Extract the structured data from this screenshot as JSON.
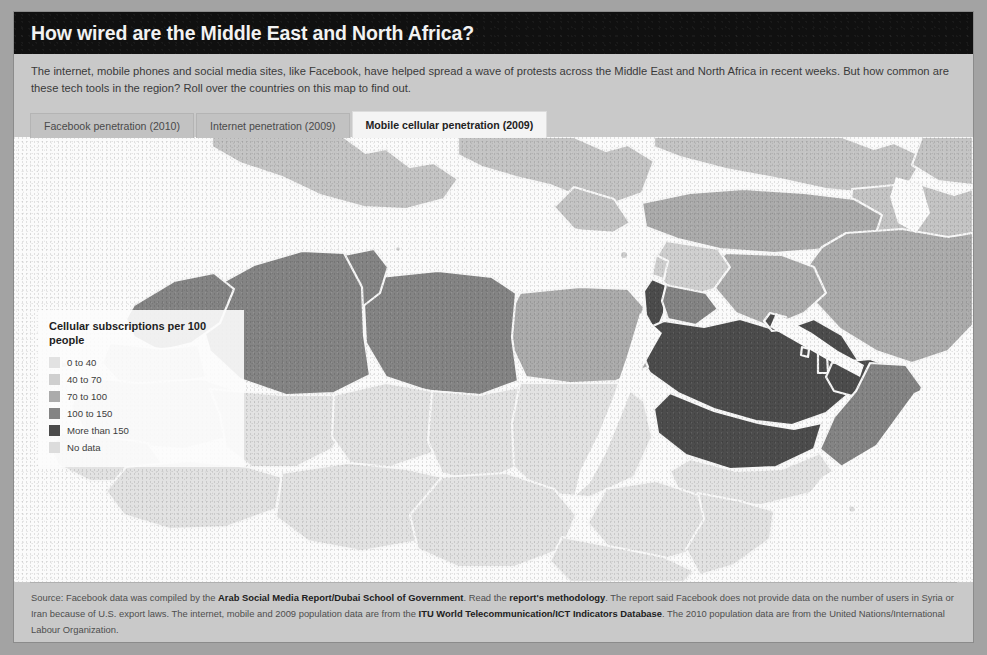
{
  "header": {
    "title": "How wired are the Middle East and North Africa?"
  },
  "intro": {
    "text": "The internet, mobile phones and social media sites, like Facebook, have helped spread a wave of protests across the Middle East and North Africa in recent weeks. But how common are these tech tools in the region? Roll over the countries on this map to find out."
  },
  "tabs": [
    {
      "label": "Facebook penetration (2010)",
      "active": false
    },
    {
      "label": "Internet penetration (2009)",
      "active": false
    },
    {
      "label": "Mobile cellular penetration (2009)",
      "active": true
    }
  ],
  "legend": {
    "title": "Cellular subscriptions per 100 people",
    "items": [
      {
        "label": "0 to 40",
        "color": "#e2e2e2"
      },
      {
        "label": "40 to 70",
        "color": "#cfcfcf"
      },
      {
        "label": "70 to 100",
        "color": "#ababab"
      },
      {
        "label": "100 to 150",
        "color": "#848484"
      },
      {
        "label": "More than 150",
        "color": "#4c4c4c"
      },
      {
        "label": "No data",
        "color": "#dcdcdc"
      }
    ]
  },
  "map": {
    "ocean_color": "#fbfbfb",
    "border_color": "#f7f7f7",
    "regions": [
      {
        "name": "Morocco",
        "bucket": "100 to 150",
        "color": "#848484"
      },
      {
        "name": "Algeria",
        "bucket": "100 to 150",
        "color": "#848484"
      },
      {
        "name": "Tunisia",
        "bucket": "100 to 150",
        "color": "#848484"
      },
      {
        "name": "Libya",
        "bucket": "100 to 150",
        "color": "#848484"
      },
      {
        "name": "Egypt",
        "bucket": "70 to 100",
        "color": "#ababab"
      },
      {
        "name": "Western Sahara",
        "bucket": "No data",
        "color": "#dcdcdc"
      },
      {
        "name": "Mauritania",
        "bucket": "0 to 40",
        "color": "#e2e2e2"
      },
      {
        "name": "Mali",
        "bucket": "0 to 40",
        "color": "#e2e2e2"
      },
      {
        "name": "Niger",
        "bucket": "0 to 40",
        "color": "#e2e2e2"
      },
      {
        "name": "Chad",
        "bucket": "0 to 40",
        "color": "#e2e2e2"
      },
      {
        "name": "Sudan",
        "bucket": "0 to 40",
        "color": "#e2e2e2"
      },
      {
        "name": "Senegal",
        "bucket": "0 to 40",
        "color": "#e2e2e2"
      },
      {
        "name": "Nigeria",
        "bucket": "0 to 40",
        "color": "#e2e2e2"
      },
      {
        "name": "Ethiopia",
        "bucket": "0 to 40",
        "color": "#e2e2e2"
      },
      {
        "name": "Somalia",
        "bucket": "0 to 40",
        "color": "#e2e2e2"
      },
      {
        "name": "Kenya",
        "bucket": "0 to 40",
        "color": "#e2e2e2"
      },
      {
        "name": "Turkey",
        "bucket": "70 to 100",
        "color": "#ababab"
      },
      {
        "name": "Syria",
        "bucket": "40 to 70",
        "color": "#cfcfcf"
      },
      {
        "name": "Iraq",
        "bucket": "70 to 100",
        "color": "#ababab"
      },
      {
        "name": "Iran",
        "bucket": "70 to 100",
        "color": "#ababab"
      },
      {
        "name": "Jordan",
        "bucket": "100 to 150",
        "color": "#848484"
      },
      {
        "name": "Israel",
        "bucket": "More than 150",
        "color": "#4c4c4c"
      },
      {
        "name": "Lebanon",
        "bucket": "40 to 70",
        "color": "#cfcfcf"
      },
      {
        "name": "Saudi Arabia",
        "bucket": "More than 150",
        "color": "#4c4c4c"
      },
      {
        "name": "Kuwait",
        "bucket": "More than 150",
        "color": "#4c4c4c"
      },
      {
        "name": "Qatar",
        "bucket": "More than 150",
        "color": "#4c4c4c"
      },
      {
        "name": "United Arab Emirates",
        "bucket": "More than 150",
        "color": "#4c4c4c"
      },
      {
        "name": "Oman",
        "bucket": "100 to 150",
        "color": "#848484"
      },
      {
        "name": "Yemen",
        "bucket": "0 to 40",
        "color": "#e2e2e2"
      },
      {
        "name": "Bahrain",
        "bucket": "More than 150",
        "color": "#4c4c4c"
      },
      {
        "name": "Europe",
        "bucket": "No data",
        "color": "#c4c4c4"
      },
      {
        "name": "Central Asia",
        "bucket": "No data",
        "color": "#c4c4c4"
      }
    ]
  },
  "footer": {
    "source_prefix": "Source: Facebook data was compiled by the ",
    "source_link1": "Arab Social Media Report/Dubai School of Government",
    "source_mid1": ". Read the ",
    "source_link2": "report's methodology",
    "source_mid2": ". The report said Facebook does not provide data on the number of users in Syria or Iran because of U.S. export laws. The internet, mobile and 2009 population data are from the ",
    "source_link3": "ITU World Telecommunication/ICT Indicators Database",
    "source_suffix": ". The 2010 population data are from the United Nations/International Labour Organization."
  }
}
